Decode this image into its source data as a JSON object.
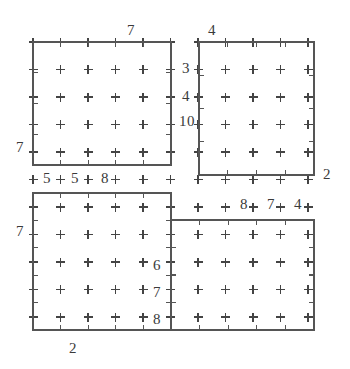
{
  "figure": {
    "background_color": "#ffffff",
    "line_color": "#555555",
    "mark_color": "#444444",
    "text_color": "#3a3a3a",
    "width": 350,
    "height": 369
  },
  "grid": {
    "origin_x": 33,
    "origin_y": 42,
    "step": 27.5,
    "cols": 11,
    "rows": 11,
    "mark_glyph": "plus",
    "mark_size": 9
  },
  "rectangles": [
    {
      "name": "top-left-rectangle",
      "x": 33,
      "y": 42,
      "width": 138,
      "height": 123,
      "tick_cols": 5,
      "tick_rows": 4
    },
    {
      "name": "top-right-rectangle",
      "x": 199,
      "y": 42,
      "width": 115,
      "height": 133,
      "tick_cols": 4,
      "tick_rows": 4
    },
    {
      "name": "bottom-left-rectangle",
      "x": 33,
      "y": 193,
      "width": 138,
      "height": 137,
      "tick_cols": 5,
      "tick_rows": 5
    },
    {
      "name": "bottom-right-rectangle",
      "x": 171,
      "y": 220,
      "width": 143,
      "height": 110,
      "tick_cols": 5,
      "tick_rows": 4
    }
  ],
  "labels": [
    {
      "id": "top-edge-top-left",
      "text": "7",
      "x": 131,
      "y": 30
    },
    {
      "id": "top-edge-top-right",
      "text": "4",
      "x": 212,
      "y": 30
    },
    {
      "id": "right-edge-top-left-a",
      "text": "3",
      "x": 186,
      "y": 68
    },
    {
      "id": "right-edge-top-left-b",
      "text": "4",
      "x": 186,
      "y": 96
    },
    {
      "id": "right-edge-top-left-c",
      "text": "10",
      "x": 187,
      "y": 121
    },
    {
      "id": "left-edge-top-left",
      "text": "7",
      "x": 20,
      "y": 147
    },
    {
      "id": "bottom-edge-top-left-a",
      "text": "5",
      "x": 47,
      "y": 178
    },
    {
      "id": "bottom-edge-top-left-b",
      "text": "5",
      "x": 75,
      "y": 178
    },
    {
      "id": "bottom-edge-top-left-c",
      "text": "8",
      "x": 105,
      "y": 178
    },
    {
      "id": "right-edge-top-right",
      "text": "2",
      "x": 327,
      "y": 174
    },
    {
      "id": "bottom-edge-top-right-a",
      "text": "8",
      "x": 244,
      "y": 204
    },
    {
      "id": "bottom-edge-top-right-b",
      "text": "7",
      "x": 271,
      "y": 204
    },
    {
      "id": "bottom-edge-top-right-c",
      "text": "4",
      "x": 298,
      "y": 204
    },
    {
      "id": "left-edge-bottom-left",
      "text": "7",
      "x": 20,
      "y": 231
    },
    {
      "id": "right-edge-bottom-left-a",
      "text": "6",
      "x": 157,
      "y": 265
    },
    {
      "id": "right-edge-bottom-left-b",
      "text": "7",
      "x": 157,
      "y": 292
    },
    {
      "id": "right-edge-bottom-left-c",
      "text": "8",
      "x": 157,
      "y": 319
    },
    {
      "id": "bottom-edge-bottom-left",
      "text": "2",
      "x": 73,
      "y": 348
    }
  ]
}
